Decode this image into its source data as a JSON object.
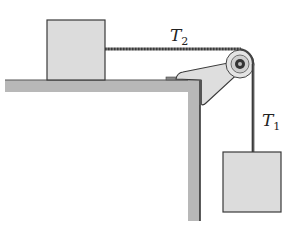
{
  "diagram": {
    "type": "physics-pulley",
    "labels": {
      "tension_horizontal": {
        "symbol": "T",
        "subscript": "2"
      },
      "tension_vertical": {
        "symbol": "T",
        "subscript": "1"
      }
    },
    "colors": {
      "block_fill": "#dcdcdc",
      "table_fill": "#b8b8b8",
      "outline": "#3a3a3a",
      "rope": "#555555",
      "background": "#ffffff"
    }
  }
}
